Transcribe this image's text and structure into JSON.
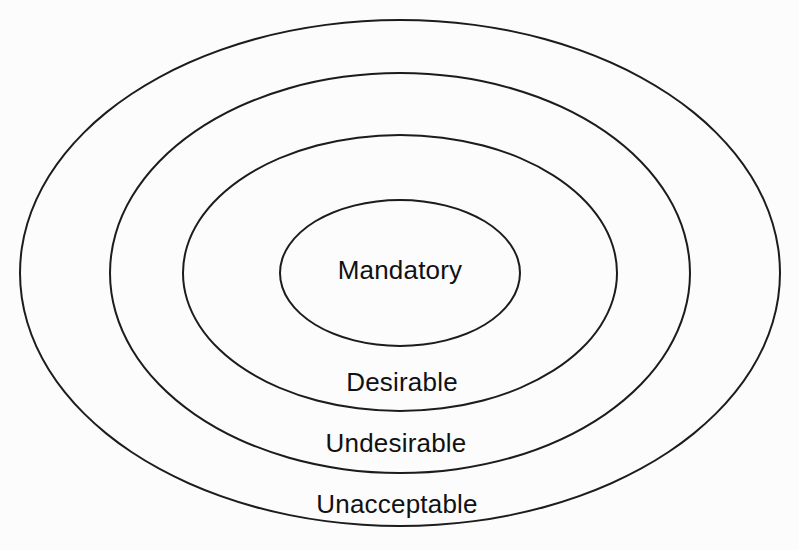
{
  "diagram": {
    "type": "concentric-ellipses",
    "rings": [
      {
        "position": "innermost",
        "label": "Mandatory"
      },
      {
        "position": "second",
        "label": "Desirable"
      },
      {
        "position": "third",
        "label": "Undesirable"
      },
      {
        "position": "outermost",
        "label": "Unacceptable"
      }
    ],
    "colors": {
      "stroke": "#1c1c1c",
      "text": "#111111",
      "background": "#fcfcfc"
    }
  }
}
